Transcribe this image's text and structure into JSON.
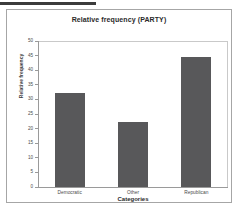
{
  "chart_data": {
    "type": "bar",
    "title": "Relative frequency (PARTY)",
    "xlabel": "Categories",
    "ylabel": "Relative frequency",
    "categories": [
      "Democratic",
      "Other",
      "Republican"
    ],
    "values": [
      32.5,
      22.5,
      45
    ],
    "ylim": [
      0,
      50
    ],
    "yticks": [
      0,
      5,
      10,
      15,
      20,
      25,
      30,
      35,
      40,
      45,
      50
    ],
    "ytick_labels": [
      "0",
      "5",
      "10",
      "15",
      "20",
      "25",
      "30",
      "35",
      "40",
      "45",
      "50"
    ],
    "grid": false,
    "legend": null,
    "bar_color": "#58585a",
    "axis_color": "#9a9a9a",
    "frame_color": "#c9c9c9",
    "background": "#ffffff"
  }
}
